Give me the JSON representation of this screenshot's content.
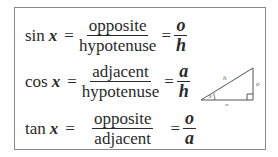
{
  "formulas": [
    {
      "fn": "sin",
      "var": "x",
      "eq": "=",
      "num": "opposite",
      "den": "hypotenuse",
      "eq2": "=",
      "short_num": "o",
      "short_den": "h"
    },
    {
      "fn": "cos",
      "var": "x",
      "eq": "=",
      "num": "adjacent",
      "den": "hypotenuse",
      "eq2": "=",
      "short_num": "a",
      "short_den": "h"
    },
    {
      "fn": "tan",
      "var": "x",
      "eq": "=",
      "num": "opposite",
      "den": "adjacent",
      "eq2": "=",
      "short_num": "o",
      "short_den": "a"
    }
  ],
  "triangle": {
    "hypotenuse_label": "h",
    "opposite_label": "o",
    "adjacent_label": "a",
    "angle_label": "x"
  }
}
